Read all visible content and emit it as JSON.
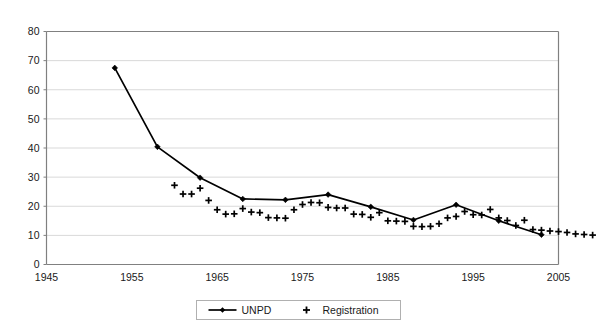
{
  "chart_data": {
    "type": "line",
    "title": "",
    "subtitle": "",
    "xlabel": "",
    "ylabel": "",
    "xlim": [
      1945,
      2005
    ],
    "ylim": [
      0,
      80
    ],
    "ytick_step": 10,
    "xtick_step": 10,
    "grid": "horizontal",
    "legend_position": "bottom",
    "xticks": [
      "1945",
      "1955",
      "1965",
      "1975",
      "1985",
      "1995",
      "2005"
    ],
    "yticks": [
      "0",
      "10",
      "20",
      "30",
      "40",
      "50",
      "60",
      "70",
      "80"
    ],
    "series": [
      {
        "name": "UNPD",
        "marker": "diamond",
        "line": true,
        "color": "#000000",
        "points": [
          {
            "x": 1953,
            "y": 67.5
          },
          {
            "x": 1958,
            "y": 40.4
          },
          {
            "x": 1963,
            "y": 29.8
          },
          {
            "x": 1968,
            "y": 22.5
          },
          {
            "x": 1973,
            "y": 22.2
          },
          {
            "x": 1978,
            "y": 24.0
          },
          {
            "x": 1983,
            "y": 19.8
          },
          {
            "x": 1988,
            "y": 15.3
          },
          {
            "x": 1993,
            "y": 20.5
          },
          {
            "x": 1998,
            "y": 15.0
          },
          {
            "x": 2003,
            "y": 10.2
          }
        ]
      },
      {
        "name": "Registration",
        "marker": "plus",
        "line": false,
        "color": "#000000",
        "points": [
          {
            "x": 1960,
            "y": 27.2
          },
          {
            "x": 1961,
            "y": 24.2
          },
          {
            "x": 1962,
            "y": 24.2
          },
          {
            "x": 1963,
            "y": 26.2
          },
          {
            "x": 1964,
            "y": 22.0
          },
          {
            "x": 1965,
            "y": 18.8
          },
          {
            "x": 1966,
            "y": 17.3
          },
          {
            "x": 1967,
            "y": 17.4
          },
          {
            "x": 1968,
            "y": 19.2
          },
          {
            "x": 1969,
            "y": 18.0
          },
          {
            "x": 1970,
            "y": 17.8
          },
          {
            "x": 1971,
            "y": 16.1
          },
          {
            "x": 1972,
            "y": 16.0
          },
          {
            "x": 1973,
            "y": 15.9
          },
          {
            "x": 1974,
            "y": 18.8
          },
          {
            "x": 1975,
            "y": 20.6
          },
          {
            "x": 1976,
            "y": 21.3
          },
          {
            "x": 1977,
            "y": 21.2
          },
          {
            "x": 1978,
            "y": 19.6
          },
          {
            "x": 1979,
            "y": 19.4
          },
          {
            "x": 1980,
            "y": 19.4
          },
          {
            "x": 1981,
            "y": 17.3
          },
          {
            "x": 1982,
            "y": 17.2
          },
          {
            "x": 1983,
            "y": 16.2
          },
          {
            "x": 1984,
            "y": 17.8
          },
          {
            "x": 1985,
            "y": 15.0
          },
          {
            "x": 1986,
            "y": 14.9
          },
          {
            "x": 1987,
            "y": 14.8
          },
          {
            "x": 1988,
            "y": 13.1
          },
          {
            "x": 1989,
            "y": 13.0
          },
          {
            "x": 1990,
            "y": 13.1
          },
          {
            "x": 1991,
            "y": 14.0
          },
          {
            "x": 1992,
            "y": 16.0
          },
          {
            "x": 1993,
            "y": 16.5
          },
          {
            "x": 1994,
            "y": 18.2
          },
          {
            "x": 1995,
            "y": 17.1
          },
          {
            "x": 1996,
            "y": 17.0
          },
          {
            "x": 1997,
            "y": 18.9
          },
          {
            "x": 1998,
            "y": 16.0
          },
          {
            "x": 1999,
            "y": 15.1
          },
          {
            "x": 2000,
            "y": 13.4
          },
          {
            "x": 2001,
            "y": 15.2
          },
          {
            "x": 2002,
            "y": 12.0
          },
          {
            "x": 2003,
            "y": 11.8
          },
          {
            "x": 2004,
            "y": 11.5
          },
          {
            "x": 2005,
            "y": 11.3
          },
          {
            "x": 2006,
            "y": 11.0
          },
          {
            "x": 2007,
            "y": 10.5
          },
          {
            "x": 2008,
            "y": 10.3
          },
          {
            "x": 2009,
            "y": 10.1
          }
        ]
      }
    ]
  },
  "legend": {
    "unpd_label": "UNPD",
    "registration_label": "Registration"
  },
  "colors": {
    "line": "#000000",
    "grid": "#d9d9d9",
    "axis": "#808080",
    "background": "#ffffff"
  }
}
